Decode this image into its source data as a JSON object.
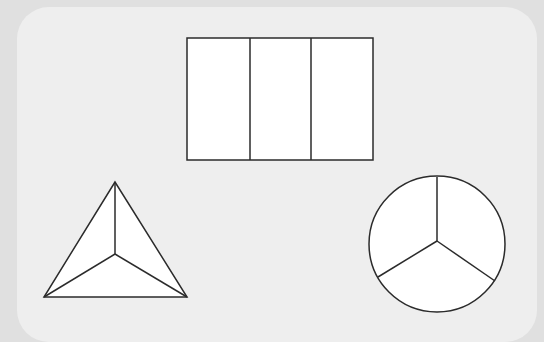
{
  "diagram": {
    "colors": {
      "background": "#e0e0e0",
      "card": "#eeeeee",
      "shape_fill": "#ffffff",
      "stroke": "#2b2b2b"
    },
    "shapes": [
      {
        "id": "rectangle",
        "type": "rectangle",
        "parts": 3,
        "x": 187,
        "y": 38,
        "width": 186,
        "height": 122,
        "dividers_x": [
          250,
          311
        ]
      },
      {
        "id": "triangle",
        "type": "triangle",
        "parts": 3,
        "vertices": [
          [
            115,
            182
          ],
          [
            44,
            297
          ],
          [
            187,
            297
          ]
        ],
        "center": [
          115,
          254
        ]
      },
      {
        "id": "circle",
        "type": "circle",
        "parts": 3,
        "cx": 437,
        "cy": 244,
        "r": 68,
        "spoke_center": [
          437,
          241
        ],
        "spoke_ends": [
          [
            437,
            177
          ],
          [
            378,
            277
          ],
          [
            495,
            281
          ]
        ]
      }
    ]
  }
}
